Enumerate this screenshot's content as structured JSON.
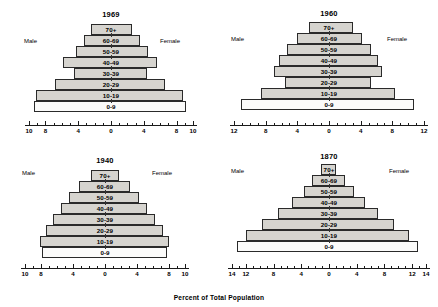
{
  "figure": {
    "xlabel": "Percent of Total Population",
    "male_label": "Male",
    "female_label": "Female",
    "age_groups": [
      "70+",
      "60-69",
      "50-59",
      "40-49",
      "30-39",
      "20-29",
      "10-19",
      "0-9"
    ],
    "colors": {
      "bar_fill": "#d6d4cf",
      "bar_fill_light": "#fbfbfa",
      "bar_stroke": "#2a2a2a",
      "axis": "#1a1a1a",
      "background": "#ffffff"
    }
  },
  "chart_data": [
    {
      "type": "bar",
      "title": "1969",
      "xlabel": "Percent of Total Population",
      "ylabel": "",
      "categories": [
        "70+",
        "60-69",
        "50-59",
        "40-49",
        "30-39",
        "20-29",
        "10-19",
        "0-9"
      ],
      "xlim": [
        -10,
        10
      ],
      "xticks": [
        -10,
        -8,
        -4,
        0,
        4,
        8,
        10
      ],
      "xticklabels": [
        "10",
        "8",
        "4",
        "0",
        "4",
        "8",
        "10"
      ],
      "grid": false,
      "series": [
        {
          "name": "Male",
          "values": [
            2.4,
            3.3,
            4.3,
            5.9,
            4.5,
            6.8,
            9.1,
            9.4
          ]
        },
        {
          "name": "Female",
          "values": [
            2.6,
            3.5,
            4.5,
            5.6,
            4.4,
            6.6,
            8.8,
            9.2
          ]
        }
      ]
    },
    {
      "type": "bar",
      "title": "1960",
      "xlabel": "Percent of Total Population",
      "ylabel": "",
      "categories": [
        "70+",
        "60-69",
        "50-59",
        "40-49",
        "30-39",
        "20-29",
        "10-19",
        "0-9"
      ],
      "xlim": [
        -12,
        12
      ],
      "xticks": [
        -12,
        -8,
        -4,
        0,
        4,
        8,
        12
      ],
      "xticklabels": [
        "12",
        "8",
        "4",
        "0",
        "4",
        "8",
        "12"
      ],
      "grid": false,
      "series": [
        {
          "name": "Male",
          "values": [
            2.5,
            4.0,
            5.3,
            6.3,
            7.0,
            5.5,
            8.6,
            11.1
          ]
        },
        {
          "name": "Female",
          "values": [
            3.0,
            4.2,
            5.3,
            6.2,
            6.7,
            5.3,
            8.4,
            10.7
          ]
        }
      ]
    },
    {
      "type": "bar",
      "title": "1940",
      "xlabel": "Percent of Total Population",
      "ylabel": "",
      "categories": [
        "70+",
        "60-69",
        "50-59",
        "40-49",
        "30-39",
        "20-29",
        "10-19",
        "0-9"
      ],
      "xlim": [
        -10,
        10
      ],
      "xticks": [
        -10,
        -8,
        -4,
        0,
        4,
        8,
        10
      ],
      "xticklabels": [
        "10",
        "8",
        "4",
        "0",
        "4",
        "8",
        "10"
      ],
      "grid": false,
      "series": [
        {
          "name": "Male",
          "values": [
            1.8,
            3.2,
            4.5,
            5.5,
            6.5,
            7.4,
            8.1,
            7.9
          ]
        },
        {
          "name": "Female",
          "values": [
            1.8,
            3.1,
            4.3,
            5.3,
            6.3,
            7.3,
            8.0,
            7.8
          ]
        }
      ]
    },
    {
      "type": "bar",
      "title": "1870",
      "xlabel": "Percent of Total Population",
      "ylabel": "",
      "categories": [
        "70+",
        "60-69",
        "50-59",
        "40-49",
        "30-39",
        "20-29",
        "10-19",
        "0-9"
      ],
      "xlim": [
        -14,
        14
      ],
      "xticks": [
        -14,
        -12,
        -8,
        -4,
        0,
        4,
        8,
        12,
        14
      ],
      "xticklabels": [
        "14",
        "12",
        "8",
        "4",
        "0",
        "4",
        "8",
        "12",
        "14"
      ],
      "grid": false,
      "series": [
        {
          "name": "Male",
          "values": [
            1.1,
            2.4,
            3.6,
            5.4,
            7.3,
            9.6,
            12.0,
            13.3
          ]
        },
        {
          "name": "Female",
          "values": [
            1.0,
            2.3,
            3.6,
            5.2,
            7.1,
            9.4,
            11.6,
            12.9
          ]
        }
      ]
    }
  ]
}
